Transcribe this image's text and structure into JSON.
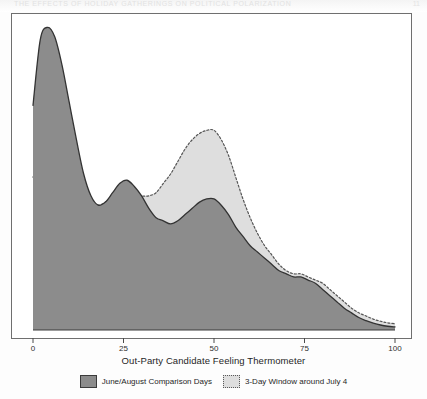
{
  "page": {
    "running_head": "THE EFFECTS OF HOLIDAY GATHERINGS ON POLITICAL POLARIZATION",
    "page_number": "11"
  },
  "chart_data": {
    "type": "area",
    "title": "",
    "subtitle": "",
    "xlabel": "Out-Party Candidate Feeling Thermometer",
    "ylabel": "",
    "xlim": [
      0,
      100
    ],
    "ylim": [
      0,
      1.0
    ],
    "xticks": [
      0,
      25,
      50,
      75,
      100
    ],
    "xtick_labels": [
      "0",
      "25",
      "50",
      "75",
      "100"
    ],
    "yticks": [],
    "ytick_labels": [],
    "grid": false,
    "legend_position": "bottom-center",
    "colors": {
      "series_1_fill": "#8c8c8c",
      "series_1_line": "#333333",
      "series_2_fill": "#dedede",
      "series_2_line": "#555555",
      "frame": "#6f6f6f",
      "background": "#ffffff"
    },
    "x": [
      0,
      2,
      4,
      6,
      8,
      10,
      12,
      14,
      16,
      18,
      20,
      22,
      24,
      26,
      28,
      30,
      32,
      34,
      36,
      38,
      40,
      42,
      44,
      46,
      48,
      50,
      52,
      54,
      56,
      58,
      60,
      62,
      64,
      66,
      68,
      70,
      72,
      74,
      76,
      78,
      80,
      82,
      84,
      86,
      88,
      90,
      92,
      94,
      96,
      98,
      100
    ],
    "series": [
      {
        "name": "June/August Comparison Days",
        "style": "solid",
        "fill": "#8c8c8c",
        "line": "#333333",
        "values": [
          0.72,
          0.93,
          0.97,
          0.94,
          0.85,
          0.73,
          0.61,
          0.5,
          0.43,
          0.4,
          0.41,
          0.44,
          0.47,
          0.48,
          0.46,
          0.43,
          0.39,
          0.36,
          0.35,
          0.34,
          0.35,
          0.37,
          0.39,
          0.41,
          0.42,
          0.42,
          0.4,
          0.37,
          0.33,
          0.3,
          0.27,
          0.25,
          0.23,
          0.21,
          0.19,
          0.18,
          0.17,
          0.17,
          0.16,
          0.15,
          0.13,
          0.11,
          0.09,
          0.07,
          0.055,
          0.04,
          0.03,
          0.022,
          0.016,
          0.012,
          0.01
        ]
      },
      {
        "name": "3-Day Window around July 4",
        "style": "dotted",
        "fill": "#dedede",
        "line": "#555555",
        "values": [
          0.49,
          0.53,
          0.55,
          0.56,
          0.55,
          0.52,
          0.48,
          0.44,
          0.41,
          0.4,
          0.41,
          0.43,
          0.45,
          0.45,
          0.44,
          0.43,
          0.43,
          0.44,
          0.47,
          0.5,
          0.54,
          0.58,
          0.61,
          0.63,
          0.64,
          0.64,
          0.61,
          0.56,
          0.49,
          0.42,
          0.36,
          0.31,
          0.27,
          0.24,
          0.21,
          0.19,
          0.18,
          0.18,
          0.17,
          0.16,
          0.15,
          0.13,
          0.11,
          0.09,
          0.07,
          0.055,
          0.045,
          0.035,
          0.028,
          0.023,
          0.02
        ]
      }
    ],
    "legend": [
      {
        "label": "June/August Comparison Days",
        "swatch": "solid"
      },
      {
        "label": "3-Day Window around July 4",
        "swatch": "dotted"
      }
    ]
  }
}
